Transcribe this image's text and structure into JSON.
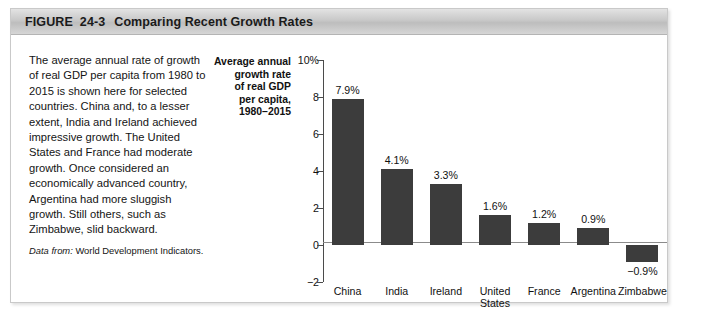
{
  "figure": {
    "label": "FIGURE",
    "number": "24-3",
    "title": "Comparing Recent Growth Rates"
  },
  "caption": {
    "body": "The average annual rate of growth of real GDP per capita from 1980 to 2015 is shown here for selected countries. China and, to a lesser extent, India and Ireland achieved impressive growth. The United States and France had moderate growth. Once considered an economically advanced country, Argentina had more sluggish growth. Still others, such as Zimbabwe, slid backward.",
    "source_label": "Data from:",
    "source_text": "World Development Indicators."
  },
  "chart_data": {
    "type": "bar",
    "title_lines": [
      "Average annual",
      "growth rate",
      "of real GDP",
      "per capita,",
      "1980–2015"
    ],
    "xlabel": "",
    "ylabel": "Average annual growth rate of real GDP per capita, 1980–2015",
    "categories": [
      "China",
      "India",
      "Ireland",
      "United States",
      "France",
      "Argentina",
      "Zimbabwe"
    ],
    "category_lines": [
      [
        "China"
      ],
      [
        "India"
      ],
      [
        "Ireland"
      ],
      [
        "United",
        "States"
      ],
      [
        "France"
      ],
      [
        "Argentina"
      ],
      [
        "Zimbabwe"
      ]
    ],
    "values": [
      7.9,
      4.1,
      3.3,
      1.6,
      1.2,
      0.9,
      -0.9
    ],
    "data_labels": [
      "7.9%",
      "4.1%",
      "3.3%",
      "1.6%",
      "1.2%",
      "0.9%",
      "−0.9%"
    ],
    "ylim": [
      -2,
      10
    ],
    "yticks": [
      10,
      8,
      6,
      4,
      2,
      0,
      -2
    ],
    "ytick_labels": [
      "10%",
      "8",
      "6",
      "4",
      "2",
      "0",
      "−2"
    ],
    "grid": false,
    "legend": false,
    "bar_color": "#3c3c3c",
    "axis_color": "#4b4b4b",
    "zero_line_color": "#8b8b8b"
  }
}
